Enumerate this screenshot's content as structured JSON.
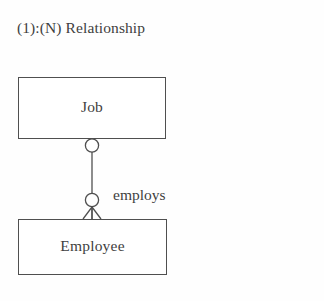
{
  "diagram": {
    "title": "(1):(N) Relationship",
    "type": "entity-relationship-diagram",
    "notation": "crow's foot",
    "colors": {
      "background": "#fefefe",
      "stroke": "#4f4f4f",
      "text": "#3f3f3f",
      "box_fill": "#ffffff"
    },
    "entities": [
      {
        "id": "job",
        "label": "Job",
        "x": 18,
        "y": 77,
        "width": 148,
        "height": 62
      },
      {
        "id": "employee",
        "label": "Employee",
        "x": 18,
        "y": 219,
        "width": 149,
        "height": 56
      }
    ],
    "relationship": {
      "label": "employs",
      "from": "Job",
      "to": "Employee",
      "cardinality": "one-to-many",
      "from_marker": "circle-optional",
      "to_marker": "circle-and-crows-foot",
      "line_x": 92,
      "line_top_y": 139,
      "line_bottom_y": 219
    }
  }
}
